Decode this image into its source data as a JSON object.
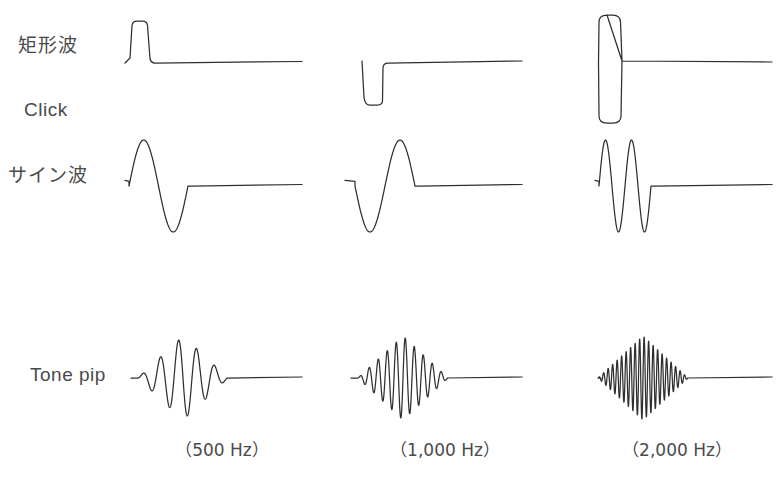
{
  "figure": {
    "background_color": "#ffffff",
    "line_color": "#2f2f2f",
    "text_color": "#4a4a4a",
    "width": 783,
    "height": 495
  },
  "row_labels": [
    {
      "id": "square-wave",
      "text": "矩形波",
      "language": "ja",
      "x": 18,
      "y": 44
    },
    {
      "id": "click",
      "text": "Click",
      "language": "en",
      "x": 24,
      "y": 110
    },
    {
      "id": "sine-wave",
      "text": "サイン波",
      "language": "ja",
      "x": 8,
      "y": 172
    },
    {
      "id": "tone-pip",
      "text": "Tone pip",
      "language": "en",
      "x": 30,
      "y": 364
    }
  ],
  "column_labels": [
    {
      "id": "freq-500",
      "text": "（500 Hz）",
      "frequency_hz": 500,
      "center_x": 222,
      "y": 436
    },
    {
      "id": "freq-1000",
      "text": "（1,000 Hz）",
      "frequency_hz": 1000,
      "center_x": 444,
      "y": 436
    },
    {
      "id": "freq-2000",
      "text": "（2,000 Hz）",
      "frequency_hz": 2000,
      "center_x": 678,
      "y": 436
    }
  ],
  "chart_data": {
    "type": "line",
    "title": "",
    "xlabel": "",
    "ylabel": "",
    "grid": false,
    "legend_position": "none",
    "columns": [
      {
        "name": "500 Hz",
        "origin_x": 125,
        "end_x": 302
      },
      {
        "name": "1,000 Hz",
        "origin_x": 345,
        "end_x": 522
      },
      {
        "name": "2,000 Hz",
        "origin_x": 595,
        "end_x": 772
      }
    ],
    "rows": [
      {
        "name": "矩形波 / Click",
        "baseline_y": 63
      },
      {
        "name": "サイン波",
        "baseline_y": 186
      },
      {
        "name": "Tone pip",
        "baseline_y": 378
      }
    ],
    "series": [
      {
        "name": "square-500",
        "row": "矩形波 / Click",
        "column": "500 Hz",
        "waveform": "square-pulse",
        "polarity": "positive",
        "cycles": 1,
        "amplitude_px": 42,
        "pulse_start_x": 131,
        "pulse_end_x": 147,
        "baseline_y": 63
      },
      {
        "name": "square-1000",
        "row": "矩形波 / Click",
        "column": "1,000 Hz",
        "waveform": "square-pulse",
        "polarity": "negative",
        "cycles": 1,
        "amplitude_px": 42,
        "pulse_start_x": 365,
        "pulse_end_x": 382,
        "baseline_y": 63
      },
      {
        "name": "square-2000",
        "row": "矩形波 / Click",
        "column": "2,000 Hz",
        "waveform": "square-pulse",
        "polarity": "bipolar",
        "cycles": 1,
        "amplitude_px": 48,
        "pulse_start_x": 600,
        "pulse_end_x": 620,
        "baseline_y": 63
      },
      {
        "name": "sine-500",
        "row": "サイン波",
        "column": "500 Hz",
        "waveform": "sine-burst",
        "polarity": "positive-first",
        "cycles": 1,
        "amplitude_px": 46,
        "burst_start_x": 129,
        "burst_end_x": 188,
        "baseline_y": 186
      },
      {
        "name": "sine-1000",
        "row": "サイン波",
        "column": "1,000 Hz",
        "waveform": "sine-burst",
        "polarity": "negative-first",
        "cycles": 1,
        "amplitude_px": 46,
        "burst_start_x": 355,
        "burst_end_x": 415,
        "baseline_y": 186
      },
      {
        "name": "sine-2000",
        "row": "サイン波",
        "column": "2,000 Hz",
        "waveform": "sine-burst",
        "polarity": "positive-first",
        "cycles": 2,
        "amplitude_px": 46,
        "burst_start_x": 599,
        "burst_end_x": 651,
        "baseline_y": 186
      },
      {
        "name": "tonepip-500",
        "row": "Tone pip",
        "column": "500 Hz",
        "waveform": "tone-pip",
        "envelope": "triangular",
        "cycles": 5,
        "amplitude_px": 42,
        "burst_start_x": 138,
        "burst_end_x": 228,
        "baseline_y": 378
      },
      {
        "name": "tonepip-1000",
        "row": "Tone pip",
        "column": "1,000 Hz",
        "waveform": "tone-pip",
        "envelope": "triangular",
        "cycles": 10,
        "amplitude_px": 42,
        "burst_start_x": 358,
        "burst_end_x": 448,
        "baseline_y": 378
      },
      {
        "name": "tonepip-2000",
        "row": "Tone pip",
        "column": "2,000 Hz",
        "waveform": "tone-pip",
        "envelope": "triangular",
        "cycles": 20,
        "amplitude_px": 42,
        "burst_start_x": 598,
        "burst_end_x": 688,
        "baseline_y": 378
      }
    ]
  }
}
